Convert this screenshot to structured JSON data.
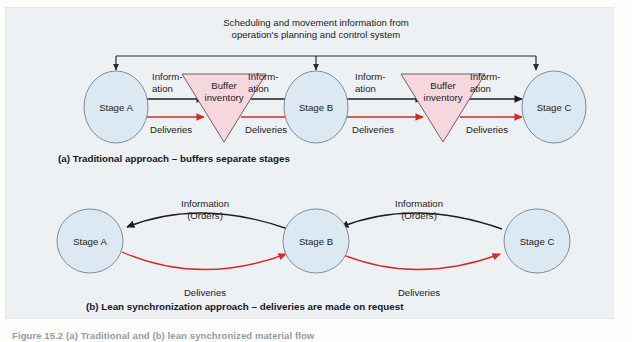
{
  "figure": {
    "bottom_caption": "Figure 15.2 (a) Traditional and (b) lean synchronized material flow"
  },
  "panel_a": {
    "bus_label_line1": "Scheduling and movement information from",
    "bus_label_line2": "operation's planning and control system",
    "caption": "(a) Traditional approach – buffers separate stages",
    "nodes": [
      {
        "id": "stage-a",
        "label": "Stage A"
      },
      {
        "id": "buffer-1",
        "label_line1": "Buffer",
        "label_line2": "inventory"
      },
      {
        "id": "stage-b",
        "label": "Stage B"
      },
      {
        "id": "buffer-2",
        "label_line1": "Buffer",
        "label_line2": "inventory"
      },
      {
        "id": "stage-c",
        "label": "Stage C"
      }
    ],
    "flow_labels": [
      {
        "id": "info-1",
        "line1": "Inform-",
        "line2": "ation",
        "delivery": "Deliveries"
      },
      {
        "id": "info-2",
        "line1": "Inform-",
        "line2": "ation",
        "delivery": "Deliveries"
      },
      {
        "id": "info-3",
        "line1": "Inform-",
        "line2": "ation",
        "delivery": "Deliveries"
      },
      {
        "id": "info-4",
        "line1": "Inform-",
        "line2": "ation",
        "delivery": "Deliveries"
      }
    ]
  },
  "panel_b": {
    "caption": "(b) Lean synchronization approach – deliveries are made on request",
    "nodes": [
      {
        "id": "stage-a",
        "label": "Stage A"
      },
      {
        "id": "stage-b",
        "label": "Stage B"
      },
      {
        "id": "stage-c",
        "label": "Stage C"
      }
    ],
    "links": [
      {
        "id": "a-b",
        "info_line1": "Information",
        "info_line2": "(Orders)",
        "delivery": "Deliveries"
      },
      {
        "id": "b-c",
        "info_line1": "Information",
        "info_line2": "(Orders)",
        "delivery": "Deliveries"
      }
    ]
  },
  "colors": {
    "panel_background": "#eef1f3",
    "stage_fill": "#dce9f3",
    "stage_stroke": "#7b8d9c",
    "buffer_fill": "#f7d7de",
    "buffer_stroke": "#6f5d66",
    "information_arrow": "#1d1d1d",
    "delivery_arrow": "#d42a22",
    "text": "#1c1c1c"
  }
}
